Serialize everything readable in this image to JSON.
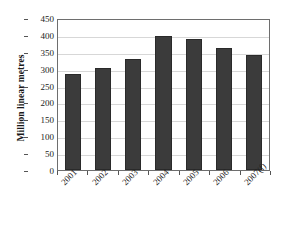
{
  "chart_data": {
    "type": "bar",
    "title": "",
    "xlabel": "",
    "ylabel": "Million linear metres",
    "categories": [
      "2001",
      "2002",
      "2003",
      "2004",
      "2005",
      "2006",
      "2007(f)"
    ],
    "values": [
      283,
      302,
      330,
      396,
      387,
      361,
      340
    ],
    "series": [
      {
        "name": "Million linear metres",
        "values": [
          283,
          302,
          330,
          396,
          387,
          361,
          340
        ]
      }
    ],
    "ylim": [
      0,
      450
    ],
    "ytick_step": 50,
    "ytick_labels": [
      "0",
      "50",
      "100",
      "150",
      "200",
      "250",
      "300",
      "350",
      "400",
      "450"
    ],
    "grid": "horizontal",
    "legend": "none",
    "bar_color": "#3b3b3b",
    "bar_edge_color": "#2a2a2a",
    "gridline_color": "#d7d7d7",
    "plot_border_color": "#6e6e6e",
    "background_color": "#ffffff",
    "xlabel_rotation": -45
  }
}
